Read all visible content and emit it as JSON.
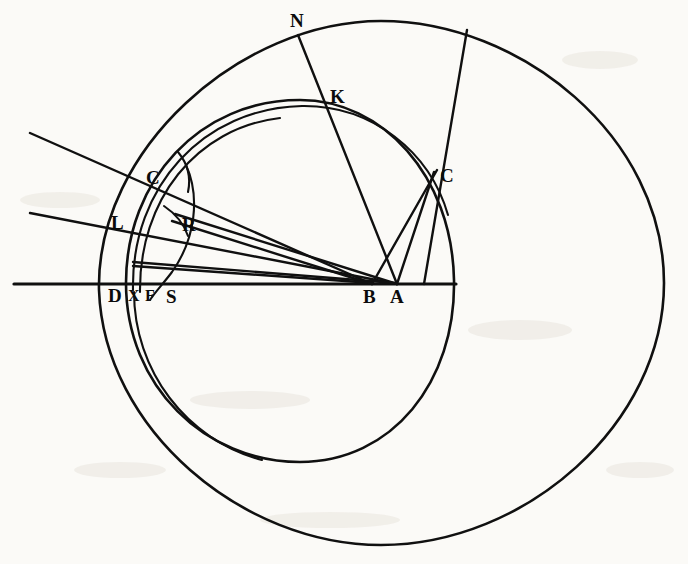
{
  "figure": {
    "background_color": "#fbfaf7",
    "ink_color": "#101010",
    "width": 688,
    "height": 564
  },
  "labels": [
    {
      "id": "N",
      "text": "N",
      "x": 298,
      "y": 35,
      "tx": 290,
      "ty": 27,
      "role": "point-on-outer-circle"
    },
    {
      "id": "K",
      "text": "K",
      "x": 328,
      "y": 108,
      "tx": 330,
      "ty": 100,
      "role": "intersection-inner-arc"
    },
    {
      "id": "C1",
      "text": "C",
      "x": 157,
      "y": 180,
      "tx": 147,
      "ty": 180,
      "role": "left-refraction-point"
    },
    {
      "id": "C2",
      "text": "C",
      "x": 434,
      "y": 175,
      "tx": 438,
      "ty": 180,
      "role": "right-refraction-point"
    },
    {
      "id": "L",
      "text": "L",
      "x": 128,
      "y": 222,
      "tx": 113,
      "ty": 228,
      "role": "left-entry-point"
    },
    {
      "id": "R",
      "text": "R",
      "x": 186,
      "y": 222,
      "tx": 185,
      "ty": 229,
      "role": "interior-crossing-point"
    },
    {
      "id": "D",
      "text": "D",
      "x": 120,
      "y": 290,
      "tx": 110,
      "ty": 300,
      "role": "axis-point-left"
    },
    {
      "id": "X",
      "text": "X",
      "x": 139,
      "y": 290,
      "tx": 131,
      "ty": 299,
      "role": "axis-point"
    },
    {
      "id": "F",
      "text": "F",
      "x": 155,
      "y": 290,
      "tx": 148,
      "ty": 299,
      "role": "axis-point"
    },
    {
      "id": "S",
      "text": "S",
      "x": 176,
      "y": 290,
      "tx": 169,
      "ty": 300,
      "role": "axis-point"
    },
    {
      "id": "B",
      "text": "B",
      "x": 372,
      "y": 290,
      "tx": 364,
      "ty": 301,
      "role": "axis-point-center"
    },
    {
      "id": "A",
      "text": "A",
      "x": 397,
      "y": 290,
      "tx": 391,
      "ty": 301,
      "role": "axis-point-hub"
    }
  ],
  "shapes": {
    "outer_circle": {
      "name": "outer-circle",
      "cx": 381,
      "cy": 283,
      "rx": 283,
      "ry": 262
    },
    "inner_oval": {
      "name": "inner-oval",
      "cx": 285,
      "cy": 283,
      "rx": 168,
      "ry": 178
    },
    "mid_arc": {
      "name": "mid-arc"
    },
    "axis_line": {
      "name": "horizontal-axis",
      "x1": 14,
      "y1": 284,
      "x2": 456,
      "y2": 284
    }
  },
  "rays": [
    {
      "name": "incident-ray-upper",
      "from": "left-edge",
      "to": "C-left",
      "through": "B"
    },
    {
      "name": "incident-ray-lower",
      "from": "left-edge",
      "to": "L",
      "through": "A"
    },
    {
      "name": "ray-N-to-A",
      "from": "N",
      "to": "A",
      "through": "K"
    },
    {
      "name": "ray-topright-to-A",
      "from": "outer-circle-top-right",
      "to": "A",
      "through": "C-right"
    },
    {
      "name": "ray-C-right-to-B",
      "from": "C-right",
      "to": "B"
    },
    {
      "name": "ray-R-to-A",
      "from": "R",
      "to": "A"
    },
    {
      "name": "ray-R-to-B",
      "from": "R",
      "to": "B"
    },
    {
      "name": "ray-D-to-A",
      "from": "D",
      "to": "A"
    }
  ]
}
